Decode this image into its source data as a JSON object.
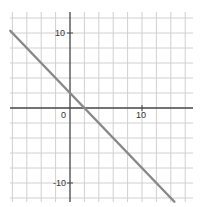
{
  "chart_data": {
    "type": "line",
    "title": "",
    "xlabel": "",
    "ylabel": "",
    "xlim": [
      -8.3,
      17
    ],
    "ylim": [
      -12.5,
      12.6
    ],
    "grid": true,
    "grid_step": 2,
    "x_tick_labels": [
      "0",
      "10"
    ],
    "y_tick_labels": [
      "10",
      "-10"
    ],
    "series": [
      {
        "name": "y = -x + 2",
        "slope": -1,
        "intercept": 2,
        "x": [
          -8.3,
          14.5
        ],
        "y": [
          10.3,
          -12.5
        ],
        "color": "#888888"
      }
    ]
  },
  "labels": {
    "origin": "0",
    "x_ten": "10",
    "y_ten": "10",
    "y_neg_ten": "-10"
  },
  "colors": {
    "grid": "#d0d0d0",
    "axis": "#444444",
    "line": "#8a8a8a"
  }
}
